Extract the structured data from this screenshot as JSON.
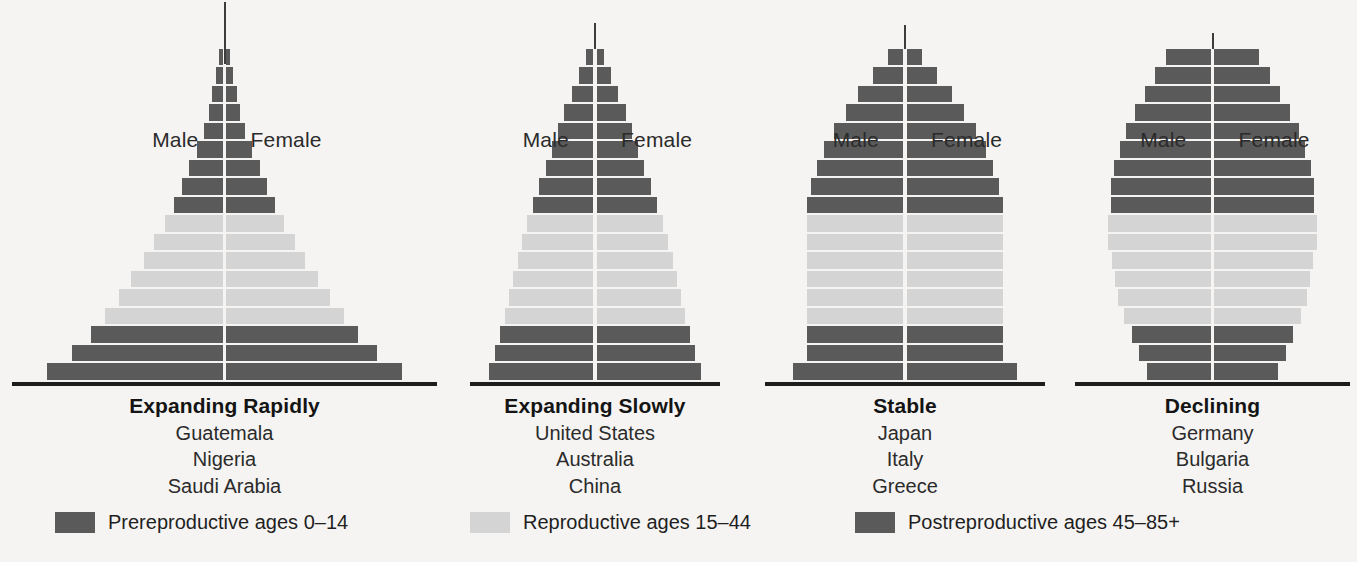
{
  "figure": {
    "kind": "population-age-structure-diagram",
    "background": "#f5f4f2"
  },
  "colors": {
    "dark": "#5a5a5a",
    "light": "#d4d4d4",
    "axis": "#1d1d1d",
    "divider": "#ffffff",
    "text": "#1f1f1f"
  },
  "axis_labels": {
    "male": "Male",
    "female": "Female"
  },
  "legend": {
    "items": [
      {
        "label": "Prereproductive ages 0–14",
        "color": "#5a5a5a",
        "x": 55
      },
      {
        "label": "Reproductive ages 15–44",
        "color": "#d4d4d4",
        "x": 470
      },
      {
        "label": "Postreproductive ages 45–85+",
        "color": "#5a5a5a",
        "x": 855
      }
    ]
  },
  "chart_data": {
    "type": "bar",
    "title": "",
    "subtype": "population pyramid (age-sex structure)",
    "xlabel": "",
    "ylabel": "",
    "legend_position": "bottom",
    "grid": false,
    "age_groups": [
      "0–4",
      "5–9",
      "10–14",
      "15–19",
      "20–24",
      "25–29",
      "30–34",
      "35–39",
      "40–44",
      "45–49",
      "50–54",
      "55–59",
      "60–64",
      "65–69",
      "70–74",
      "75–79",
      "80–84",
      "85+"
    ],
    "band_of_group": [
      "pre",
      "pre",
      "pre",
      "rep",
      "rep",
      "rep",
      "rep",
      "rep",
      "rep",
      "post",
      "post",
      "post",
      "post",
      "post",
      "post",
      "post",
      "post",
      "post"
    ],
    "band_colors": {
      "pre": "#5a5a5a",
      "rep": "#d4d4d4",
      "post": "#5a5a5a"
    },
    "note": "values are relative half-widths (percent of the widest bar in the set), read bottom-up from the youngest age group",
    "series": [
      {
        "name": "Expanding Rapidly",
        "countries": [
          "Guatemala",
          "Nigeria",
          "Saudi Arabia"
        ],
        "values": [
          100,
          86,
          75,
          67,
          59,
          52,
          45,
          39,
          33,
          28,
          23,
          19,
          15,
          11,
          8,
          6,
          4,
          2
        ]
      },
      {
        "name": "Expanding Slowly",
        "countries": [
          "United States",
          "Australia",
          "China"
        ],
        "values": [
          100,
          95,
          90,
          85,
          81,
          77,
          73,
          69,
          64,
          58,
          52,
          46,
          40,
          34,
          28,
          21,
          14,
          7
        ]
      },
      {
        "name": "Stable",
        "countries": [
          "Japan",
          "Italy",
          "Greece"
        ],
        "values": [
          100,
          88,
          88,
          88,
          88,
          88,
          88,
          88,
          88,
          88,
          84,
          79,
          72,
          63,
          52,
          41,
          28,
          14
        ]
      },
      {
        "name": "Declining",
        "countries": [
          "Germany",
          "Bulgaria",
          "Russia"
        ],
        "values": [
          62,
          70,
          77,
          84,
          90,
          93,
          96,
          100,
          100,
          97,
          97,
          94,
          88,
          82,
          74,
          64,
          54,
          44
        ]
      }
    ]
  },
  "panels": [
    {
      "title": "Expanding Rapidly",
      "countries": [
        "Guatemala",
        "Nigeria",
        "Saudi Arabia"
      ],
      "left": 12,
      "width": 425,
      "maxHalf": 176,
      "spire": 62
    },
    {
      "title": "Expanding Slowly",
      "countries": [
        "United States",
        "Australia",
        "China"
      ],
      "left": 470,
      "width": 250,
      "maxHalf": 104,
      "spire": 26
    },
    {
      "title": "Stable",
      "countries": [
        "Japan",
        "Italy",
        "Greece"
      ],
      "left": 765,
      "width": 280,
      "maxHalf": 110,
      "spire": 24
    },
    {
      "title": "Declining",
      "countries": [
        "Germany",
        "Bulgaria",
        "Russia"
      ],
      "left": 1075,
      "width": 275,
      "maxHalf": 103,
      "spire": 16
    }
  ]
}
